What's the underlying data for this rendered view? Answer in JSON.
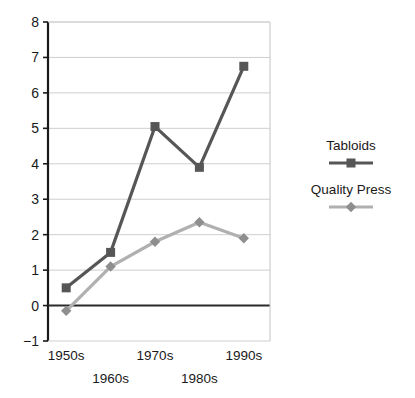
{
  "chart_data": {
    "type": "line",
    "title": "",
    "xlabel": "",
    "ylabel": "",
    "categories": [
      "1950s",
      "1960s",
      "1970s",
      "1980s",
      "1990s"
    ],
    "series": [
      {
        "name": "Tabloids",
        "values": [
          0.5,
          1.5,
          5.05,
          3.9,
          6.75
        ],
        "color": "#565656",
        "marker": "square"
      },
      {
        "name": "Quality Press",
        "values": [
          -0.15,
          1.1,
          1.8,
          2.35,
          1.9
        ],
        "color": "#b0b0b0",
        "marker": "diamond",
        "marker_color": "#8e8e8e"
      }
    ],
    "yticks": [
      -1,
      0,
      1,
      2,
      3,
      4,
      5,
      6,
      7,
      8
    ],
    "ylim": [
      -1,
      8
    ],
    "grid": true,
    "legend_position": "right",
    "zero_line": true
  },
  "legend": {
    "items": [
      {
        "label": "Tabloids"
      },
      {
        "label": "Quality Press"
      }
    ]
  }
}
